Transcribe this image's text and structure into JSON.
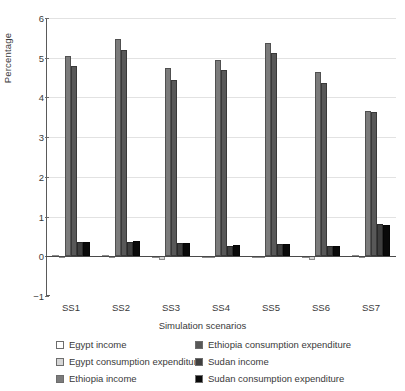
{
  "chart_data": {
    "type": "bar",
    "title": "",
    "xlabel": "Simulation scenarios",
    "ylabel": "Percentage",
    "categories": [
      "SS1",
      "SS2",
      "SS3",
      "SS4",
      "SS5",
      "SS6",
      "SS7"
    ],
    "ylim": [
      -1,
      6
    ],
    "yticks": [
      -1,
      0,
      1,
      2,
      3,
      4,
      5,
      6
    ],
    "ytick_labels": [
      "−1",
      "0",
      "1",
      "2",
      "3",
      "4",
      "5",
      "6"
    ],
    "grid": true,
    "legend_position": "below-axis",
    "series": [
      {
        "name": "Egypt income",
        "color": "#ffffff",
        "values": [
          0.02,
          0.02,
          0.0,
          0.01,
          0.01,
          0.0,
          0.02
        ]
      },
      {
        "name": "Egypt consumption expenditure",
        "color": "#d6d6d6",
        "values": [
          -0.02,
          -0.03,
          -0.09,
          -0.04,
          -0.02,
          -0.1,
          -0.03
        ]
      },
      {
        "name": "Ethiopia income",
        "color": "#7b7b7b",
        "values": [
          5.04,
          5.47,
          4.73,
          4.95,
          5.38,
          4.65,
          3.65
        ]
      },
      {
        "name": "Ethiopia consumption expenditure",
        "color": "#585858",
        "values": [
          4.78,
          5.2,
          4.45,
          4.68,
          5.11,
          4.37,
          3.63
        ]
      },
      {
        "name": "Sudan income",
        "color": "#3f3f3f",
        "values": [
          0.36,
          0.37,
          0.33,
          0.27,
          0.3,
          0.26,
          0.81
        ]
      },
      {
        "name": "Sudan consumption expenditure",
        "color": "#0a0a0a",
        "values": [
          0.37,
          0.38,
          0.34,
          0.28,
          0.31,
          0.27,
          0.78
        ]
      }
    ]
  },
  "axis": {
    "ylabel": "Percentage",
    "xlabel": "Simulation scenarios"
  }
}
